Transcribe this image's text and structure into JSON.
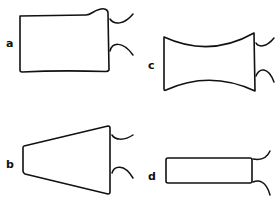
{
  "figure": {
    "panels": [
      {
        "id": "a",
        "label": "a",
        "shape": "rectangle with bulged top-right corner",
        "leads": 2
      },
      {
        "id": "b",
        "label": "b",
        "shape": "trapezoid widening to the right",
        "leads": 2
      },
      {
        "id": "c",
        "label": "c",
        "shape": "rectangle with concave top and bottom",
        "leads": 2
      },
      {
        "id": "d",
        "label": "d",
        "shape": "narrow rectangle",
        "leads": 2
      }
    ],
    "colors": {
      "stroke": "#111111",
      "background": "#ffffff"
    }
  }
}
